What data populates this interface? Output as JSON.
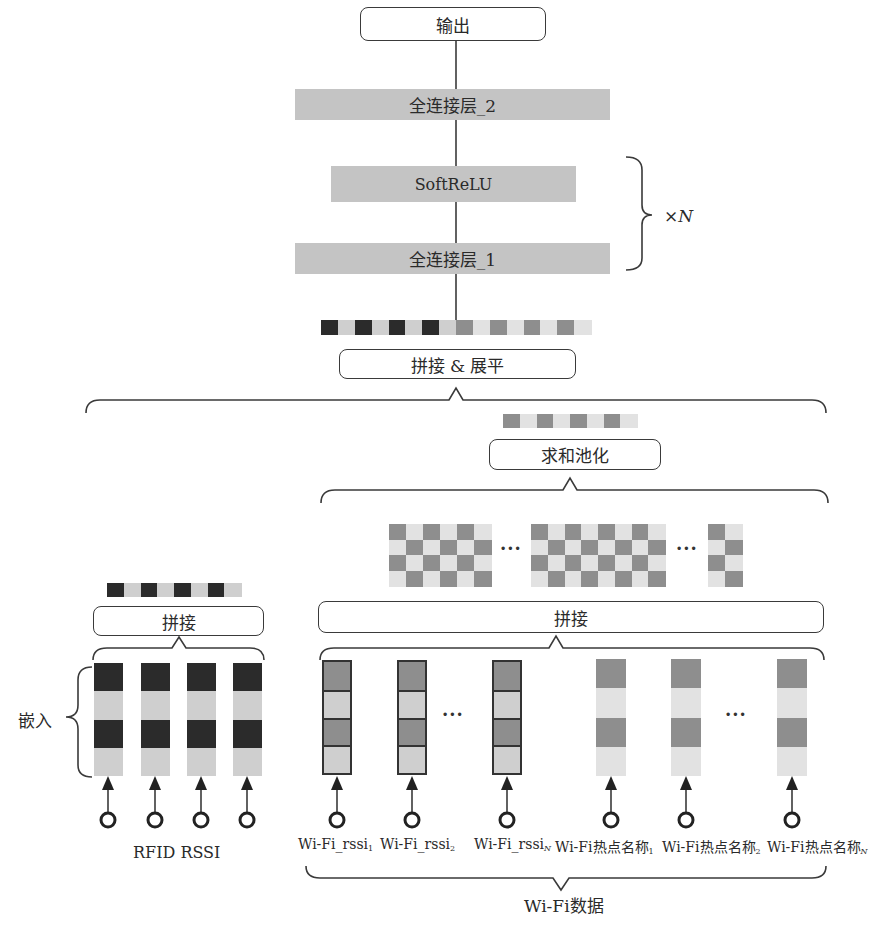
{
  "top": {
    "output_label": "输出",
    "fc2_label": "全连接层_2",
    "softrelu_label": "SoftReLU",
    "fc1_label": "全连接层_1",
    "repeat_label": "×N"
  },
  "merge": {
    "concat_flatten_label": "拼接 & 展平"
  },
  "wifi_branch": {
    "sum_pool_label": "求和池化",
    "concat_label": "拼接",
    "ellipsis": "···",
    "rssi_inputs": [
      {
        "text": "Wi-Fi_rssi",
        "sub": "1"
      },
      {
        "text": "Wi-Fi_rssi",
        "sub": "2"
      },
      {
        "text": "Wi-Fi_rssi",
        "sub": "N"
      }
    ],
    "name_inputs": [
      {
        "text": "Wi-Fi热点名称",
        "sub": "1"
      },
      {
        "text": "Wi-Fi热点名称",
        "sub": "2"
      },
      {
        "text": "Wi-Fi热点名称",
        "sub": "N"
      }
    ],
    "group_label": "Wi-Fi数据"
  },
  "rfid_branch": {
    "concat_label": "拼接",
    "embed_label": "嵌入",
    "group_label": "RFID RSSI",
    "input_count": 4
  },
  "colors": {
    "line": "#3a3a3a",
    "layer_fill": "#c4c4c4",
    "dark_cell": "#2b2b2b",
    "medium_cell": "#8e8e8e",
    "light_cell": "#cfcfcf",
    "lighter_cell": "#e2e2e2"
  },
  "vectors": {
    "flatten_cells": [
      "dark",
      "light",
      "dark",
      "light",
      "dark",
      "light",
      "dark",
      "light",
      "medium",
      "lighter",
      "medium",
      "lighter",
      "medium",
      "lighter",
      "medium",
      "lighter"
    ],
    "sum_pool_cells": [
      "medium",
      "lighter",
      "medium",
      "lighter",
      "medium",
      "lighter",
      "medium",
      "lighter"
    ],
    "rfid_concat_cells": [
      "dark",
      "light",
      "dark",
      "light",
      "dark",
      "light",
      "dark",
      "light"
    ],
    "checker_blocks": [
      {
        "cols": 6,
        "rows": 4
      },
      {
        "cols": 8,
        "rows": 4
      },
      {
        "cols": 2,
        "rows": 4
      }
    ]
  }
}
